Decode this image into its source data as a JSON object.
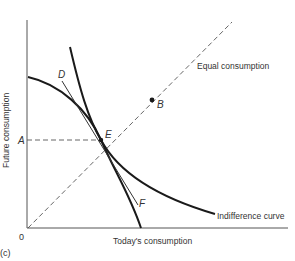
{
  "figure": {
    "panel_label": "(c)",
    "x_axis_label": "Today's consumption",
    "y_axis_label": "Future consumption",
    "origin_label": "0",
    "y_mark_label": "A",
    "equal_consumption_label": "Equal consumption",
    "indifference_curve_label": "Indifference curve",
    "points": {
      "B": "B",
      "D": "D",
      "E": "E",
      "F": "F"
    },
    "colors": {
      "ink": "#1a1a1a",
      "dashed": "#555555",
      "text": "#333333"
    }
  }
}
